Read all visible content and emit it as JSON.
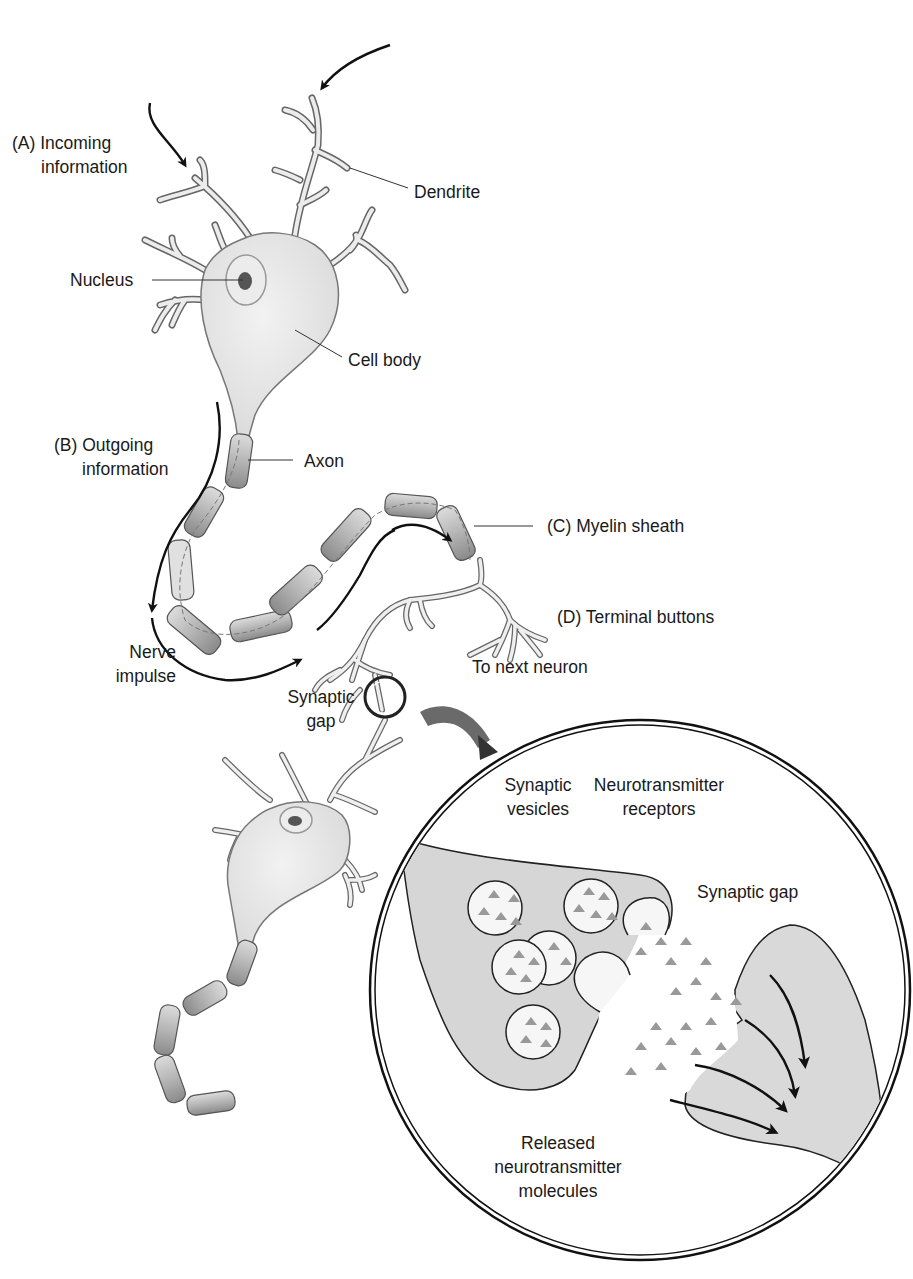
{
  "diagram": {
    "type": "neuron-anatomy",
    "colors": {
      "cell_fill": "#e6e6e6",
      "cell_stroke": "#555555",
      "myelin_fill": "#b8b8b8",
      "myelin_light": "#dcdcdc",
      "arrow": "#111111",
      "molecule": "#9a9a9a",
      "text": "#1a1a1a"
    }
  },
  "labels": {
    "incoming": {
      "line1": "(A) Incoming",
      "line2": "information"
    },
    "dendrite": "Dendrite",
    "nucleus": "Nucleus",
    "cell_body": "Cell body",
    "outgoing": {
      "line1": "(B) Outgoing",
      "line2": "information"
    },
    "axon": "Axon",
    "myelin": "(C) Myelin sheath",
    "terminal": "(D) Terminal buttons",
    "to_next": "To next neuron",
    "nerve_impulse": {
      "line1": "Nerve",
      "line2": "impulse"
    },
    "synaptic_gap_small": {
      "line1": "Synaptic",
      "line2": "gap"
    },
    "inset": {
      "vesicles": {
        "line1": "Synaptic",
        "line2": "vesicles"
      },
      "receptors": {
        "line1": "Neurotransmitter",
        "line2": "receptors"
      },
      "synaptic_gap": "Synaptic gap",
      "released": {
        "line1": "Released",
        "line2": "neurotransmitter",
        "line3": "molecules"
      }
    }
  }
}
